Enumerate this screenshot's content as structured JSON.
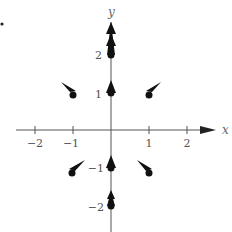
{
  "diagram": {
    "type": "vector-field",
    "axes": {
      "x_label": "x",
      "y_label": "y",
      "x_ticks": [
        "−2",
        "−1",
        "1",
        "2"
      ],
      "y_ticks": [
        "2",
        "1",
        "−1",
        "−2"
      ]
    },
    "vectors": [
      {
        "point": [
          0,
          2
        ],
        "direction": "up",
        "length": "long"
      },
      {
        "point": [
          0,
          1
        ],
        "direction": "up",
        "length": "short"
      },
      {
        "point": [
          0,
          -1
        ],
        "direction": "up",
        "length": "short"
      },
      {
        "point": [
          0,
          -2
        ],
        "direction": "up",
        "length": "medium"
      },
      {
        "point": [
          -1,
          1
        ],
        "direction": "up-left"
      },
      {
        "point": [
          1,
          1
        ],
        "direction": "up-right"
      },
      {
        "point": [
          -1,
          -1
        ],
        "direction": "up-right"
      },
      {
        "point": [
          1,
          -1
        ],
        "direction": "up-left"
      }
    ],
    "colors": {
      "ink": "#111111",
      "axis": "#555555"
    }
  }
}
